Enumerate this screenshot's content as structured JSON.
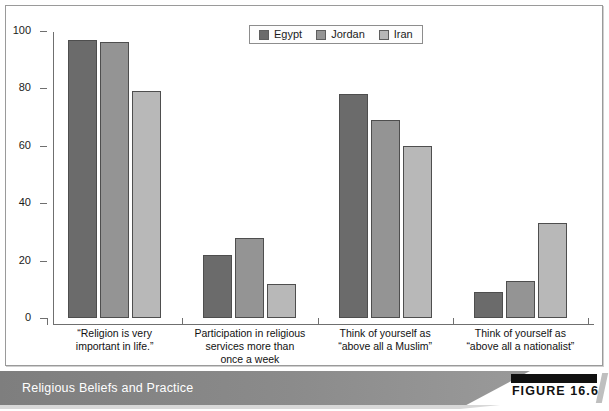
{
  "figure": {
    "caption": "Religious Beliefs and Practice",
    "figure_number": "FIGURE 16.6"
  },
  "legend": {
    "position": "top-center",
    "items": [
      {
        "label": "Egypt",
        "color": "#6b6b6b"
      },
      {
        "label": "Jordan",
        "color": "#949494"
      },
      {
        "label": "Iran",
        "color": "#b8b8b8"
      }
    ]
  },
  "axis": {
    "y_ticks": [
      "0",
      "20",
      "40",
      "60",
      "80",
      "100"
    ]
  },
  "categories": [
    "“Religion is very\nimportant in life.”",
    "Participation in religious\nservices more than\nonce a week",
    "Think of yourself as\n“above all a Muslim”",
    "Think of yourself as\n“above all a nationalist”"
  ],
  "cat_lines": [
    [
      "“Religion is very",
      "important in life.”"
    ],
    [
      "Participation in religious",
      "services more than",
      "once a week"
    ],
    [
      "Think of yourself as",
      "“above all a Muslim”"
    ],
    [
      "Think of yourself as",
      "“above all a nationalist”"
    ]
  ],
  "chart_data": {
    "type": "bar",
    "title": "Religious Beliefs and Practice",
    "xlabel": "",
    "ylabel": "",
    "ylim": [
      0,
      100
    ],
    "yticks": [
      0,
      20,
      40,
      60,
      80,
      100
    ],
    "grid": false,
    "legend_position": "top-center",
    "categories": [
      "“Religion is very important in life.”",
      "Participation in religious services more than once a week",
      "Think of yourself as “above all a Muslim”",
      "Think of yourself as “above all a nationalist”"
    ],
    "series": [
      {
        "name": "Egypt",
        "color": "#6b6b6b",
        "values": [
          97,
          22,
          78,
          9
        ]
      },
      {
        "name": "Jordan",
        "color": "#949494",
        "values": [
          96,
          28,
          69,
          13
        ]
      },
      {
        "name": "Iran",
        "color": "#b8b8b8",
        "values": [
          79,
          12,
          60,
          33
        ]
      }
    ]
  }
}
